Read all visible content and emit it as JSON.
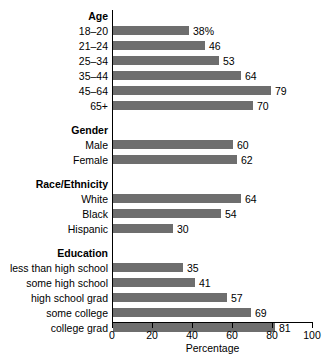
{
  "chart_data": {
    "type": "bar",
    "orientation": "horizontal",
    "title": "",
    "xlabel": "Percentage",
    "ylabel": "",
    "xlim": [
      0,
      100
    ],
    "xticks": [
      0,
      20,
      40,
      60,
      80,
      100
    ],
    "xtick_labels": [
      "0",
      "20",
      "40",
      "60",
      "80",
      "100"
    ],
    "grid": false,
    "legend": false,
    "bar_color": "#6e6e6e",
    "axis_color": "#000000",
    "background_color": "#ffffff",
    "groups": [
      {
        "header": "Age",
        "categories": [
          "18–20",
          "21–24",
          "25–34",
          "35–44",
          "45–64",
          "65+"
        ],
        "values": [
          38,
          46,
          53,
          64,
          79,
          70
        ],
        "value_labels": [
          "38%",
          "46",
          "53",
          "64",
          "79",
          "70"
        ]
      },
      {
        "header": "Gender",
        "categories": [
          "Male",
          "Female"
        ],
        "values": [
          60,
          62
        ],
        "value_labels": [
          "60",
          "62"
        ]
      },
      {
        "header": "Race/Ethnicity",
        "categories": [
          "White",
          "Black",
          "Hispanic"
        ],
        "values": [
          64,
          54,
          30
        ],
        "value_labels": [
          "64",
          "54",
          "30"
        ]
      },
      {
        "header": "Education",
        "categories": [
          "less than high school",
          "some high school",
          "high school grad",
          "some college",
          "college grad"
        ],
        "values": [
          35,
          41,
          57,
          69,
          81
        ],
        "value_labels": [
          "35",
          "41",
          "57",
          "69",
          "81"
        ]
      }
    ]
  }
}
